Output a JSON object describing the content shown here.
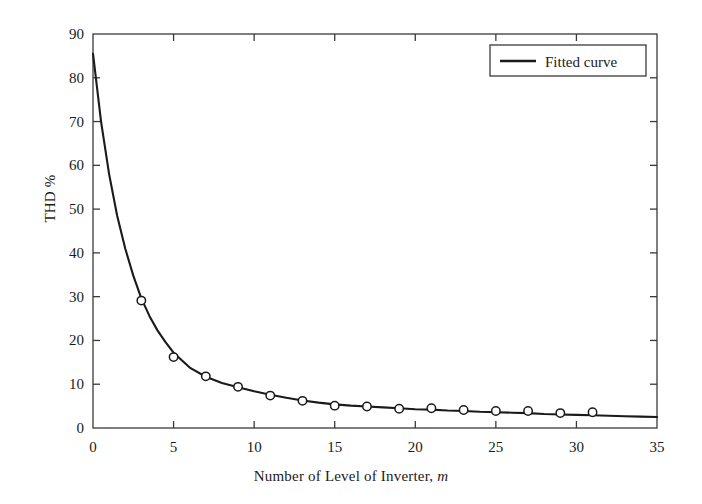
{
  "chart_data": {
    "type": "line",
    "title": "",
    "xlabel": "Number of Level of Inverter, m",
    "xlabel_plain": "Number of Level of Inverter,",
    "xlabel_italic": "m",
    "ylabel": "THD %",
    "xlim": [
      0,
      35
    ],
    "ylim": [
      0,
      90
    ],
    "xticks": [
      0,
      5,
      10,
      15,
      20,
      25,
      30,
      35
    ],
    "yticks": [
      0,
      10,
      20,
      30,
      40,
      50,
      60,
      70,
      80,
      90
    ],
    "xtick_labels": [
      "0",
      "5",
      "10",
      "15",
      "20",
      "25",
      "30",
      "35"
    ],
    "ytick_labels": [
      "0",
      "10",
      "20",
      "30",
      "40",
      "50",
      "60",
      "70",
      "80",
      "90"
    ],
    "grid": false,
    "legend_position": "top-right",
    "series": [
      {
        "name": "Fitted curve",
        "style": "solid-line",
        "color": "#1a1a1a",
        "x": [
          0,
          0.5,
          1,
          1.5,
          2,
          2.5,
          3,
          3.5,
          4,
          4.5,
          5,
          6,
          7,
          8,
          9,
          10,
          11,
          12,
          13,
          14,
          15,
          16,
          17,
          18,
          19,
          20,
          21,
          22,
          23,
          24,
          25,
          26,
          27,
          28,
          29,
          30,
          31,
          32,
          33,
          34,
          35
        ],
        "y": [
          85.5,
          70.0,
          58.0,
          48.5,
          41.0,
          34.8,
          29.6,
          25.6,
          22.3,
          19.6,
          17.2,
          13.8,
          11.7,
          10.3,
          9.3,
          8.4,
          7.6,
          6.9,
          6.3,
          5.8,
          5.4,
          5.1,
          4.9,
          4.7,
          4.5,
          4.3,
          4.2,
          4.0,
          3.9,
          3.7,
          3.6,
          3.5,
          3.4,
          3.2,
          3.1,
          3.0,
          2.9,
          2.8,
          2.7,
          2.6,
          2.5
        ]
      },
      {
        "name": "Measured points",
        "style": "open-circle-markers",
        "color": "#1a1a1a",
        "x": [
          3,
          5,
          7,
          9,
          11,
          13,
          15,
          17,
          19,
          21,
          23,
          25,
          27,
          29,
          31
        ],
        "y": [
          29.1,
          16.2,
          11.8,
          9.4,
          7.4,
          6.2,
          5.1,
          4.9,
          4.4,
          4.5,
          4.1,
          3.9,
          3.9,
          3.4,
          3.6
        ]
      }
    ],
    "legend_entries": [
      {
        "label": "Fitted curve",
        "marker": "line",
        "color": "#1a1a1a"
      }
    ]
  }
}
